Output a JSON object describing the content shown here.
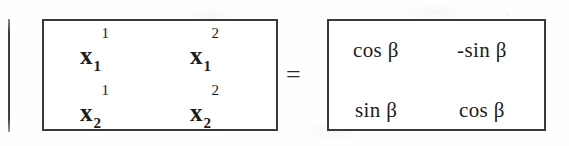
{
  "document": {
    "kind": "scanned-math-equation",
    "description": "Matrix of basis vector components equals a 2x2 rotation matrix"
  },
  "colors": {
    "ink": "#1c1c1c",
    "border": "#3a3a3a",
    "paper": "#fefefe",
    "rule": "#3c3c3c"
  },
  "left_rule": {
    "name": "vertical-rule"
  },
  "equals": {
    "symbol": "="
  },
  "lhs_matrix": {
    "name": "components-matrix",
    "rows": [
      [
        {
          "base": "x",
          "sub": "1",
          "sup": "1"
        },
        {
          "base": "x",
          "sub": "1",
          "sup": "2"
        }
      ],
      [
        {
          "base": "x",
          "sub": "2",
          "sup": "1"
        },
        {
          "base": "x",
          "sub": "2",
          "sup": "2"
        }
      ]
    ]
  },
  "rhs_matrix": {
    "name": "rotation-matrix",
    "angle": "β",
    "rows": [
      [
        {
          "text": "cos",
          "arg": "β",
          "full": "cos β"
        },
        {
          "text": "-sin",
          "arg": "β",
          "full": "-sin β"
        }
      ],
      [
        {
          "text": "sin",
          "arg": "β",
          "full": "sin β"
        },
        {
          "text": "cos",
          "arg": "β",
          "full": "cos β"
        }
      ]
    ]
  }
}
